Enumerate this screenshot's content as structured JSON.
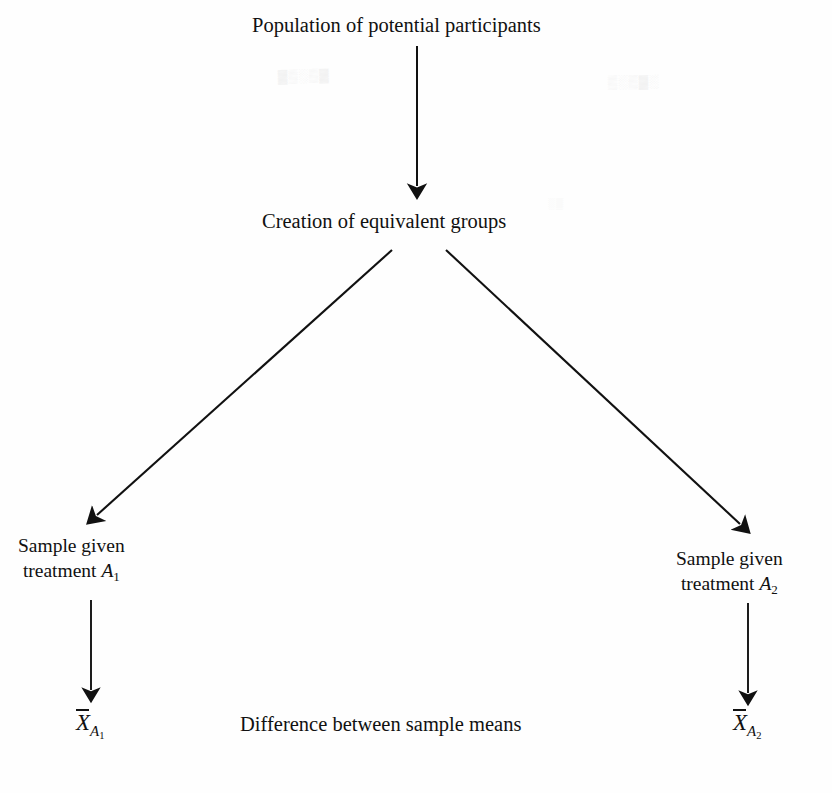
{
  "figure": {
    "type": "flow-diagram",
    "background_color": "#fefefe",
    "ink_color": "#111111"
  },
  "nodes": {
    "population": {
      "text": "Population of potential participants",
      "x": 252,
      "y": 12
    },
    "equivalent_groups": {
      "text": "Creation of equivalent groups",
      "x": 262,
      "y": 208
    },
    "left_sample": {
      "line1": "Sample given",
      "line2_prefix": "treatment ",
      "line2_var": "A",
      "line2_sub": "1",
      "x": 18,
      "y": 533
    },
    "right_sample": {
      "line1": "Sample given",
      "line2_prefix": "treatment ",
      "line2_var": "A",
      "line2_sub": "2",
      "x": 676,
      "y": 546
    },
    "left_mean": {
      "symbol": "X",
      "sub_var": "A",
      "sub_num": "1",
      "x": 76,
      "y": 707
    },
    "right_mean": {
      "symbol": "X",
      "sub_var": "A",
      "sub_num": "2",
      "x": 733,
      "y": 707
    },
    "difference": {
      "text": "Difference between sample means",
      "x": 240,
      "y": 711
    }
  },
  "arrows": [
    {
      "name": "population-to-groups",
      "from": [
        417,
        46
      ],
      "to": [
        417,
        196
      ],
      "direction": "down",
      "stroke_width": 2.0
    },
    {
      "name": "groups-to-left-sample",
      "from": [
        392,
        250
      ],
      "to": [
        90,
        522
      ],
      "direction": "down-left",
      "stroke_width": 2.1
    },
    {
      "name": "groups-to-right-sample",
      "from": [
        446,
        250
      ],
      "to": [
        747,
        531
      ],
      "direction": "down-right",
      "stroke_width": 2.1
    },
    {
      "name": "left-sample-to-mean",
      "from": [
        91,
        600
      ],
      "to": [
        91,
        700
      ],
      "direction": "down",
      "stroke_width": 1.9
    },
    {
      "name": "right-sample-to-mean",
      "from": [
        748,
        603
      ],
      "to": [
        748,
        703
      ],
      "direction": "down",
      "stroke_width": 1.9
    }
  ],
  "ghost_artifacts": [
    {
      "text": "▓▒░▒▓",
      "name": "scan-ghost-left"
    },
    {
      "text": "▒░▒▓░",
      "name": "scan-ghost-right"
    },
    {
      "text": "░▒",
      "name": "scan-ghost-mid"
    }
  ]
}
